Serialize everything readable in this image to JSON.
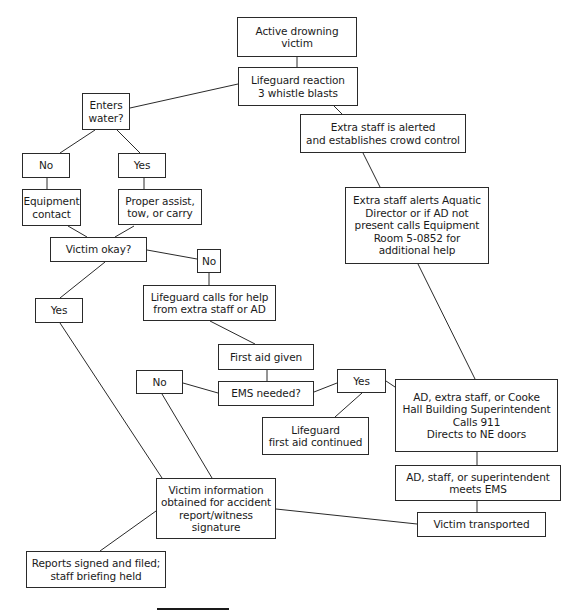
{
  "flowchart": {
    "title": "Active drowning victim emergency action plan",
    "nodes": {
      "start": "Active drowning\nvictim",
      "reaction": "Lifeguard reaction\n3 whistle blasts",
      "enters_water": "Enters\nwater?",
      "no_water": "No",
      "yes_water": "Yes",
      "equipment_contact": "Equipment\ncontact",
      "proper_assist": "Proper assist,\ntow, or carry",
      "victim_okay": "Victim okay?",
      "okay_no": "No",
      "okay_yes": "Yes",
      "calls_help": "Lifeguard calls for help\nfrom extra staff or AD",
      "first_aid": "First aid given",
      "ems_needed": "EMS needed?",
      "ems_no": "No",
      "ems_yes": "Yes",
      "first_aid_continued": "Lifeguard\nfirst aid continued",
      "staff_alerted": "Extra staff is alerted\nand establishes crowd control",
      "alerts_director": "Extra staff alerts Aquatic\nDirector or if AD not\npresent calls Equipment\nRoom 5-0852 for\nadditional help",
      "calls_911": "AD, extra staff, or Cooke\nHall Building Superintendent\nCalls 911\nDirects to NE doors",
      "meets_ems": "AD, staff, or superintendent\nmeets EMS",
      "transported": "Victim transported",
      "victim_info": "Victim information\nobtained for accident\nreport/witness\nsignature",
      "reports_signed": "Reports signed and filed;\nstaff briefing held"
    }
  }
}
